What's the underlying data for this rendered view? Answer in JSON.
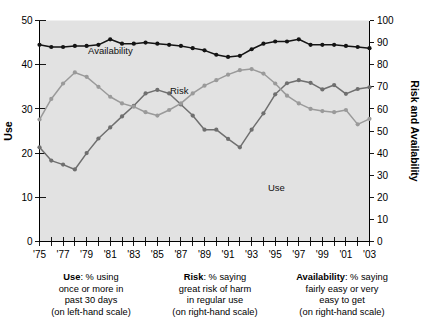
{
  "chart_data": {
    "type": "line",
    "title": "",
    "xlabel": "",
    "ylabel": "Use",
    "y2label": "Risk and Availability",
    "x": [
      "'75",
      "'76",
      "'77",
      "'78",
      "'79",
      "'80",
      "'81",
      "'82",
      "'83",
      "'84",
      "'85",
      "'86",
      "'87",
      "'88",
      "'89",
      "'90",
      "'91",
      "'92",
      "'93",
      "'94",
      "'95",
      "'96",
      "'97",
      "'98",
      "'99",
      "'00",
      "'01",
      "'02",
      "'03"
    ],
    "xtick_labels": [
      "'75",
      "'77",
      "'79",
      "'81",
      "'83",
      "'85",
      "'87",
      "'89",
      "'91",
      "'93",
      "'95",
      "'97",
      "'99",
      "'01",
      "'03"
    ],
    "ytick_labels": [
      "0",
      "10",
      "20",
      "30",
      "40",
      "50"
    ],
    "y2tick_labels": [
      "0",
      "10",
      "20",
      "30",
      "40",
      "50",
      "60",
      "70",
      "80",
      "90",
      "100"
    ],
    "ylim": [
      0,
      50
    ],
    "y2lim": [
      0,
      100
    ],
    "grid": false,
    "legend_position": "inline",
    "series": [
      {
        "name": "Use",
        "axis": "left",
        "color": "#6f6f6f",
        "label_text": "Use",
        "values": [
          21.3,
          18.3,
          17.4,
          16.3,
          20.0,
          23.3,
          25.8,
          28.3,
          30.7,
          33.5,
          34.3,
          33.5,
          31.0,
          28.5,
          25.3,
          25.3,
          23.2,
          21.3,
          25.3,
          29.0,
          33.3,
          35.8,
          36.5,
          35.9,
          34.4,
          35.4,
          33.4,
          34.5,
          34.9
        ]
      },
      {
        "name": "Risk",
        "axis": "right",
        "color": "#9a9a9a",
        "label_text": "Risk",
        "values": [
          55.2,
          64.5,
          71.5,
          76.5,
          74.5,
          70.0,
          65.5,
          62.5,
          61.0,
          58.5,
          57.0,
          59.5,
          62.5,
          67.0,
          70.5,
          73.0,
          75.5,
          77.5,
          78.0,
          76.0,
          71.5,
          66.0,
          62.5,
          60.0,
          59.0,
          58.5,
          59.5,
          53.0,
          55.5
        ]
      },
      {
        "name": "Availability",
        "axis": "right",
        "color": "#141414",
        "label_text": "Availability",
        "values": [
          89.0,
          88.0,
          88.0,
          88.5,
          88.5,
          89.0,
          91.5,
          89.5,
          89.5,
          90.0,
          89.5,
          89.0,
          88.5,
          87.5,
          86.5,
          84.5,
          83.5,
          84.0,
          87.0,
          89.5,
          90.5,
          90.5,
          91.5,
          89.0,
          89.0,
          89.0,
          88.5,
          88.0,
          87.5
        ]
      }
    ]
  },
  "axes": {
    "left_title": "Use",
    "right_title": "Risk and Availability"
  },
  "captions": [
    {
      "bold": "Use",
      "lines": [
        ": % using",
        "once or more in",
        "past 30 days",
        "(on left-hand scale)"
      ]
    },
    {
      "bold": "Risk",
      "lines": [
        ": % saying",
        "great risk of harm",
        "in regular use",
        "(on right-hand scale)"
      ]
    },
    {
      "bold": "Availability",
      "lines": [
        ": % saying",
        "fairly easy or very",
        "easy to get",
        "(on right-hand scale)"
      ]
    }
  ]
}
